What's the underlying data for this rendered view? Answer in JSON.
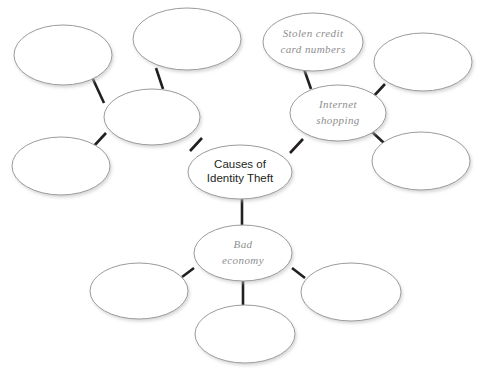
{
  "diagram": {
    "type": "mind-map",
    "background_color": "#ffffff",
    "ellipse_stroke_color": "#9b9b9d",
    "connector_color": "#231f20",
    "label_color_center": "#231f20",
    "label_color_branch": "#8e8e90",
    "nodes": [
      {
        "id": "center",
        "label_line1": "Causes of",
        "label_line2": "Identity Theft",
        "style": "center",
        "cx": 240,
        "cy": 172,
        "rx": 52,
        "ry": 27
      },
      {
        "id": "hub-left",
        "label_line1": "",
        "label_line2": "",
        "style": "branch",
        "cx": 152,
        "cy": 117,
        "rx": 48,
        "ry": 28
      },
      {
        "id": "hub-internet",
        "label_line1": "Internet",
        "label_line2": "shopping",
        "style": "branch",
        "cx": 338,
        "cy": 113,
        "rx": 48,
        "ry": 28
      },
      {
        "id": "hub-economy",
        "label_line1": "Bad",
        "label_line2": "economy",
        "style": "branch",
        "cx": 243,
        "cy": 253,
        "rx": 49,
        "ry": 28
      },
      {
        "id": "leaf-stolen-cards",
        "label_line1": "Stolen credit",
        "label_line2": "card numbers",
        "style": "branch",
        "cx": 313,
        "cy": 42,
        "rx": 50,
        "ry": 29
      },
      {
        "id": "leaf-top-left",
        "label_line1": "",
        "label_line2": "",
        "style": "branch",
        "cx": 63,
        "cy": 55,
        "rx": 49,
        "ry": 30
      },
      {
        "id": "leaf-top-middle",
        "label_line1": "",
        "label_line2": "",
        "style": "branch",
        "cx": 187,
        "cy": 39,
        "rx": 54,
        "ry": 31
      },
      {
        "id": "leaf-bottom-left-upper",
        "label_line1": "",
        "label_line2": "",
        "style": "branch",
        "cx": 61,
        "cy": 166,
        "rx": 49,
        "ry": 29
      },
      {
        "id": "leaf-right-upper",
        "label_line1": "",
        "label_line2": "",
        "style": "branch",
        "cx": 423,
        "cy": 62,
        "rx": 49,
        "ry": 29
      },
      {
        "id": "leaf-right-lower",
        "label_line1": "",
        "label_line2": "",
        "style": "branch",
        "cx": 421,
        "cy": 161,
        "rx": 49,
        "ry": 29
      },
      {
        "id": "leaf-bottom-left",
        "label_line1": "",
        "label_line2": "",
        "style": "branch",
        "cx": 139,
        "cy": 291,
        "rx": 49,
        "ry": 28
      },
      {
        "id": "leaf-bottom-center",
        "label_line1": "",
        "label_line2": "",
        "style": "branch",
        "cx": 245,
        "cy": 334,
        "rx": 50,
        "ry": 29
      },
      {
        "id": "leaf-bottom-right",
        "label_line1": "",
        "label_line2": "",
        "style": "branch",
        "cx": 351,
        "cy": 292,
        "rx": 50,
        "ry": 29
      }
    ],
    "connectors": [
      {
        "id": "center-to-hub-left",
        "from": "center",
        "to": "hub-left",
        "x1": 190,
        "y1": 151,
        "x2": 202,
        "y2": 138
      },
      {
        "id": "center-to-hub-internet",
        "from": "center",
        "to": "hub-internet",
        "x1": 290,
        "y1": 153,
        "x2": 303,
        "y2": 139
      },
      {
        "id": "center-to-hub-economy",
        "from": "center",
        "to": "hub-economy",
        "x1": 242,
        "y1": 199,
        "x2": 242,
        "y2": 226
      },
      {
        "id": "hub-left-to-leaf-top-left",
        "from": "hub-left",
        "to": "leaf-top-left",
        "x1": 104,
        "y1": 103,
        "x2": 92,
        "y2": 77
      },
      {
        "id": "hub-left-to-leaf-top-middle",
        "from": "hub-left",
        "to": "leaf-top-middle",
        "x1": 163,
        "y1": 89,
        "x2": 156,
        "y2": 68
      },
      {
        "id": "hub-left-to-leaf-bottom-left-upper",
        "from": "hub-left",
        "to": "leaf-bottom-left-upper",
        "x1": 106,
        "y1": 133,
        "x2": 93,
        "y2": 147
      },
      {
        "id": "hub-internet-to-leaf-stolen",
        "from": "hub-internet",
        "to": "leaf-stolen-cards",
        "x1": 311,
        "y1": 89,
        "x2": 304,
        "y2": 69
      },
      {
        "id": "hub-internet-to-leaf-right-upper",
        "from": "hub-internet",
        "to": "leaf-right-upper",
        "x1": 372,
        "y1": 98,
        "x2": 385,
        "y2": 84
      },
      {
        "id": "hub-internet-to-leaf-right-lower",
        "from": "hub-internet",
        "to": "leaf-right-lower",
        "x1": 371,
        "y1": 131,
        "x2": 384,
        "y2": 143
      },
      {
        "id": "hub-economy-to-leaf-bottom-left",
        "from": "hub-economy",
        "to": "leaf-bottom-left",
        "x1": 194,
        "y1": 268,
        "x2": 182,
        "y2": 277
      },
      {
        "id": "hub-economy-to-leaf-bottom-center",
        "from": "hub-economy",
        "to": "leaf-bottom-center",
        "x1": 243,
        "y1": 281,
        "x2": 243,
        "y2": 305
      },
      {
        "id": "hub-economy-to-leaf-bottom-right",
        "from": "hub-economy",
        "to": "leaf-bottom-right",
        "x1": 292,
        "y1": 268,
        "x2": 305,
        "y2": 278
      }
    ]
  }
}
